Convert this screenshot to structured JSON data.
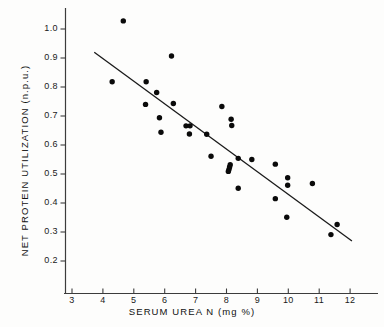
{
  "chart_data": {
    "type": "scatter",
    "title": "",
    "xlabel": "SERUM UREA N (mg %)",
    "ylabel": "NET PROTEIN UTILIZATION (n.p.u.)",
    "xlim": [
      2.3,
      12.8
    ],
    "ylim": [
      0.2,
      1.05
    ],
    "grid": false,
    "legend": "none",
    "xticks": [
      3,
      4,
      5,
      6,
      7,
      8,
      9,
      10,
      11,
      12
    ],
    "xtick_labels": [
      "3",
      "4",
      "5",
      "6",
      "7",
      "8",
      "9",
      "10",
      "11",
      "12"
    ],
    "yticks": [
      0.2,
      0.3,
      0.4,
      0.5,
      0.6,
      0.7,
      0.8,
      0.9,
      1.0
    ],
    "ytick_labels": [
      "0.2",
      "0.3",
      "0.4",
      "0.5",
      "0.6",
      "0.7",
      "0.8",
      "0.9",
      "1.0"
    ],
    "marker": "filled-circle",
    "marker_color": "#0a0a0a",
    "marker_size": 4.6,
    "points": [
      {
        "x": 4.66,
        "y": 1.028
      },
      {
        "x": 6.22,
        "y": 0.907
      },
      {
        "x": 4.3,
        "y": 0.818
      },
      {
        "x": 5.4,
        "y": 0.818
      },
      {
        "x": 5.74,
        "y": 0.781
      },
      {
        "x": 6.28,
        "y": 0.743
      },
      {
        "x": 5.38,
        "y": 0.74
      },
      {
        "x": 7.85,
        "y": 0.733
      },
      {
        "x": 5.83,
        "y": 0.694
      },
      {
        "x": 8.15,
        "y": 0.689
      },
      {
        "x": 6.69,
        "y": 0.666
      },
      {
        "x": 6.82,
        "y": 0.666
      },
      {
        "x": 8.17,
        "y": 0.667
      },
      {
        "x": 5.88,
        "y": 0.644
      },
      {
        "x": 6.8,
        "y": 0.638
      },
      {
        "x": 7.36,
        "y": 0.637
      },
      {
        "x": 7.5,
        "y": 0.561
      },
      {
        "x": 8.38,
        "y": 0.554
      },
      {
        "x": 8.82,
        "y": 0.55
      },
      {
        "x": 9.58,
        "y": 0.534
      },
      {
        "x": 8.12,
        "y": 0.532
      },
      {
        "x": 8.1,
        "y": 0.524
      },
      {
        "x": 8.08,
        "y": 0.516
      },
      {
        "x": 8.06,
        "y": 0.509
      },
      {
        "x": 9.98,
        "y": 0.487
      },
      {
        "x": 10.78,
        "y": 0.467
      },
      {
        "x": 9.98,
        "y": 0.461
      },
      {
        "x": 8.38,
        "y": 0.451
      },
      {
        "x": 9.58,
        "y": 0.415
      },
      {
        "x": 9.95,
        "y": 0.351
      },
      {
        "x": 11.58,
        "y": 0.326
      },
      {
        "x": 11.38,
        "y": 0.291
      }
    ],
    "regression_line": {
      "x_start": 3.72,
      "y_start": 0.92,
      "x_end": 12.06,
      "y_end": 0.269,
      "color": "#1a1a1a",
      "width": 1.3
    }
  },
  "axes": {
    "axis_color": "#3c3c3c",
    "tick_length": 5
  }
}
